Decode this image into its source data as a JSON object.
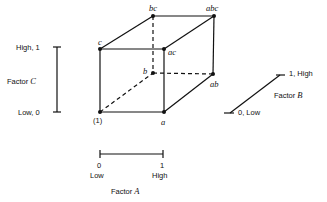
{
  "diagram": {
    "vertices": [
      {
        "id": "one",
        "label": "(1)",
        "x": 100,
        "y": 112
      },
      {
        "id": "a",
        "label": "a",
        "x": 164,
        "y": 112
      },
      {
        "id": "b",
        "label": "b",
        "x": 153,
        "y": 73
      },
      {
        "id": "ab",
        "label": "ab",
        "x": 213,
        "y": 74
      },
      {
        "id": "c",
        "label": "c",
        "x": 100,
        "y": 49
      },
      {
        "id": "ac",
        "label": "ac",
        "x": 164,
        "y": 49
      },
      {
        "id": "bc",
        "label": "bc",
        "x": 153,
        "y": 16
      },
      {
        "id": "abc",
        "label": "abc",
        "x": 214,
        "y": 16
      }
    ],
    "factor_c": {
      "name": "Factor",
      "letter": "C",
      "high": "High, 1",
      "low": "Low, 0"
    },
    "factor_b": {
      "name": "Factor",
      "letter": "B",
      "high": "1, High",
      "low": "0, Low"
    },
    "factor_a": {
      "name": "Factor",
      "letter": "A",
      "low_num": "0",
      "low": "Low",
      "high_num": "1",
      "high": "High"
    }
  }
}
